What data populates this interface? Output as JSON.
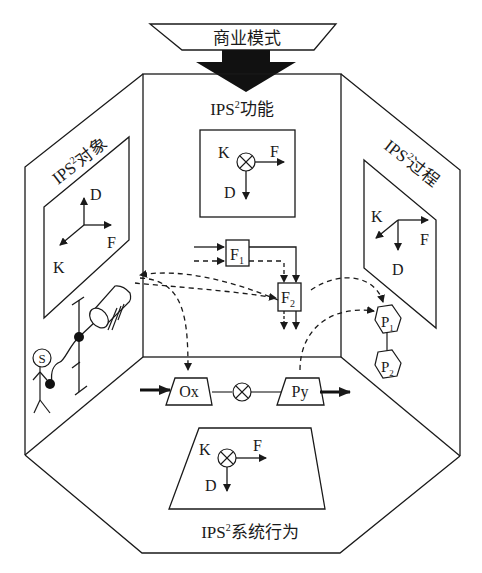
{
  "top": {
    "label": "商业模式"
  },
  "walls": {
    "back": {
      "title_prefix": "IPS",
      "title_sup": "2",
      "title_suffix": "功能"
    },
    "left": {
      "title_prefix": "IPS",
      "title_sup": "2",
      "title_suffix": "对象"
    },
    "right": {
      "title_prefix": "IPS",
      "title_sup": "2",
      "title_suffix": "过程"
    },
    "floor": {
      "title_prefix": "IPS",
      "title_sup": "2",
      "title_suffix": "系统行为"
    }
  },
  "axes": {
    "function_panel": {
      "k": "K",
      "f": "F",
      "d": "D"
    },
    "object_panel": {
      "k": "K",
      "f": "F",
      "d": "D"
    },
    "process_panel": {
      "k": "K",
      "f": "F",
      "d": "D"
    },
    "behavior_panel": {
      "k": "K",
      "f": "F",
      "d": "D"
    }
  },
  "functions": {
    "f1": {
      "base": "F",
      "sub": "1"
    },
    "f2": {
      "base": "F",
      "sub": "2"
    }
  },
  "processes": {
    "p1": {
      "base": "P",
      "sub": "1"
    },
    "p2": {
      "base": "P",
      "sub": "2"
    }
  },
  "flow": {
    "input": "Ox",
    "output": "Py"
  },
  "stakeholder": {
    "label": "S"
  },
  "colors": {
    "line": "#1a1a1a",
    "background": "#ffffff"
  }
}
